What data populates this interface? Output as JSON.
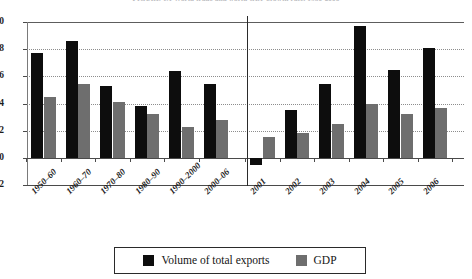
{
  "chart_data": {
    "type": "bar",
    "title": "FIGURE 1.1  World trade and world GDP growth rate, 1950-2006",
    "xlabel": "",
    "ylabel": "",
    "ylim": [
      -2,
      10
    ],
    "yticks": [
      10,
      8,
      6,
      4,
      2,
      0,
      -2
    ],
    "grid": true,
    "legend_position": "bottom",
    "categories": [
      "1950–60",
      "1960–70",
      "1970–80",
      "1980–90",
      "1990–2000",
      "2000–06",
      "2001",
      "2002",
      "2003",
      "2004",
      "2005",
      "2006"
    ],
    "series": [
      {
        "name": "Volume of total exports",
        "color": "#0d0d0d",
        "values": [
          7.7,
          8.6,
          5.3,
          3.8,
          6.4,
          5.4,
          -0.5,
          3.5,
          5.4,
          9.7,
          6.5,
          8.1
        ]
      },
      {
        "name": "GDP",
        "color": "#6e6e6e",
        "values": [
          4.5,
          5.4,
          4.1,
          3.2,
          2.3,
          2.8,
          1.5,
          1.8,
          2.5,
          4.0,
          3.2,
          3.7
        ]
      }
    ],
    "annotations": {
      "separator_after_category": "2000–06"
    }
  },
  "legend": {
    "items": [
      {
        "label": "Volume of total exports",
        "swatch": "exports"
      },
      {
        "label": "GDP",
        "swatch": "gdp"
      }
    ]
  }
}
